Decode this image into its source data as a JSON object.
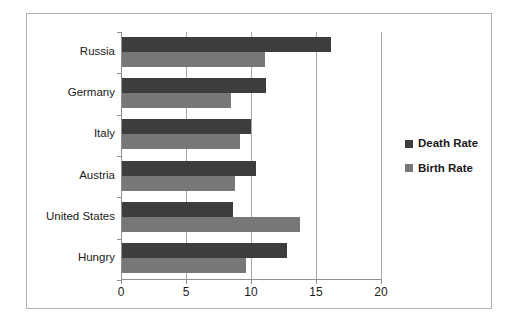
{
  "chart_data": {
    "type": "bar",
    "orientation": "horizontal",
    "title": "",
    "subtitle": "",
    "xlabel": "",
    "ylabel": "",
    "categories": [
      "Russia",
      "Germany",
      "Italy",
      "Austria",
      "United States",
      "Hungry"
    ],
    "series": [
      {
        "name": "Death Rate",
        "color": "#3d3d3d",
        "values": [
          16.1,
          11.1,
          9.9,
          10.3,
          8.5,
          12.7
        ]
      },
      {
        "name": "Birth Rate",
        "color": "#777777",
        "values": [
          11.0,
          8.4,
          9.1,
          8.7,
          13.7,
          9.5
        ]
      }
    ],
    "xlim": [
      0,
      20
    ],
    "xticks": [
      0,
      5,
      10,
      15,
      20
    ],
    "xtick_labels": [
      "0",
      "5",
      "10",
      "15",
      "20"
    ],
    "grid": "vertical",
    "legend_position": "right",
    "legend_entries": [
      "Death Rate",
      "Birth Rate"
    ]
  },
  "legend": {
    "items": [
      {
        "label": "Death Rate",
        "swatch": "legend-swatch-death-rate"
      },
      {
        "label": "Birth Rate",
        "swatch": "legend-swatch-birth-rate"
      }
    ]
  },
  "colors": {
    "death_rate": "#3d3d3d",
    "birth_rate": "#777777",
    "gridline": "#a6a6a6",
    "axis": "#8f8f8f",
    "frame_border": "#b2b2b2",
    "background": "#ffffff",
    "text": "#1a1a1a"
  }
}
